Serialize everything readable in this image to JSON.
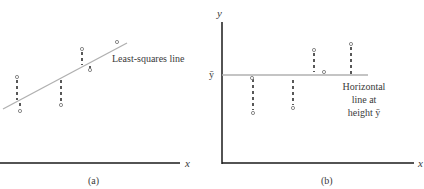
{
  "panels": [
    {
      "id": "a",
      "caption": "(a)",
      "x_axis_label": "x",
      "line_label": "Least-squares line",
      "line": {
        "x1": 3,
        "y1": 109,
        "x2": 127,
        "y2": 43
      },
      "points": [
        {
          "x": 17,
          "y": 77,
          "line_y": 101
        },
        {
          "x": 20,
          "y": 111,
          "line_y": 101
        },
        {
          "x": 61,
          "y": 105,
          "line_y": 79
        },
        {
          "x": 82,
          "y": 49,
          "line_y": 65
        },
        {
          "x": 90,
          "y": 70,
          "line_y": 65
        },
        {
          "x": 117,
          "y": 42,
          "line_y": 45
        }
      ]
    },
    {
      "id": "b",
      "caption": "(b)",
      "x_axis_label": "x",
      "y_axis_label": "y",
      "ybar_label": "ȳ",
      "line_label_lines": [
        "Horizontal",
        "line at",
        "height ȳ"
      ],
      "line": {
        "x1": 222,
        "y1": 75,
        "x2": 368,
        "y2": 75
      },
      "points": [
        {
          "x": 253,
          "y": 113,
          "line_y": 77
        },
        {
          "x": 293,
          "y": 108,
          "line_y": 80
        },
        {
          "x": 314,
          "y": 50,
          "line_y": 71
        },
        {
          "x": 324,
          "y": 72,
          "line_y": 75
        },
        {
          "x": 351,
          "y": 44,
          "line_y": 74
        }
      ]
    }
  ],
  "colors": {
    "axis": "#1a1a1a",
    "fit_line": "#b0b0b0",
    "residual": "#222222",
    "point": "#8a8a8a",
    "text": "#3a3a3a"
  }
}
